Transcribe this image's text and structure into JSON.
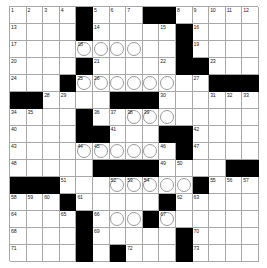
{
  "puzzle": {
    "title": "Crossword Grid",
    "rows": 15,
    "cols": 15,
    "colors": {
      "block": "#000000",
      "cell": "#ffffff",
      "gridline": "#a8a8a8",
      "number": "#222222",
      "circle": "#9a9a9a",
      "page": "#ffffff"
    },
    "legend": {
      "block_char": "#",
      "open_char": ".",
      "circle_char": "O"
    },
    "layout": [
      "....#..........",
      "....#....#.....",
      "....OOOO..#....",
      "....#....#.#...",
      "...#OOOOOO.#.##",
      "##.....###...>>",
      "....#OOOOOO....",
      "....##...##....",
      "....OOOOO.#....",
      "....#####..#.##",
      "###.#.OOOOO#...",
      "...#...#..#..>>",
      "...#.#.OOO.....",
      "....#.#...#....",
      "...#.#.#...#..."
    ],
    "numbers": [
      {
        "r": 1,
        "c": 1,
        "n": "1"
      },
      {
        "r": 1,
        "c": 2,
        "n": "2"
      },
      {
        "r": 1,
        "c": 3,
        "n": "3"
      },
      {
        "r": 1,
        "c": 4,
        "n": "4"
      },
      {
        "r": 1,
        "c": 6,
        "n": "5"
      },
      {
        "r": 1,
        "c": 7,
        "n": "6"
      },
      {
        "r": 1,
        "c": 8,
        "n": "7"
      },
      {
        "r": 1,
        "c": 11,
        "n": "8"
      },
      {
        "r": 1,
        "c": 12,
        "n": "9"
      },
      {
        "r": 1,
        "c": 13,
        "n": "10"
      },
      {
        "r": 1,
        "c": 14,
        "n": "11"
      },
      {
        "r": 1,
        "c": 15,
        "n": "12"
      },
      {
        "r": 2,
        "c": 1,
        "n": "13"
      },
      {
        "r": 2,
        "c": 6,
        "n": "14"
      },
      {
        "r": 2,
        "c": 10,
        "n": "15"
      },
      {
        "r": 2,
        "c": 12,
        "n": "16"
      },
      {
        "r": 3,
        "c": 1,
        "n": "17"
      },
      {
        "r": 3,
        "c": 5,
        "n": "18"
      },
      {
        "r": 3,
        "c": 12,
        "n": "19"
      },
      {
        "r": 4,
        "c": 1,
        "n": "20"
      },
      {
        "r": 4,
        "c": 6,
        "n": "21"
      },
      {
        "r": 4,
        "c": 10,
        "n": "22"
      },
      {
        "r": 4,
        "c": 13,
        "n": "23"
      },
      {
        "r": 5,
        "c": 1,
        "n": "24"
      },
      {
        "r": 5,
        "c": 5,
        "n": "25"
      },
      {
        "r": 5,
        "c": 6,
        "n": "26"
      },
      {
        "r": 5,
        "c": 12,
        "n": "27"
      },
      {
        "r": 6,
        "c": 3,
        "n": "28"
      },
      {
        "r": 6,
        "c": 4,
        "n": "29"
      },
      {
        "r": 6,
        "c": 10,
        "n": "30"
      },
      {
        "r": 6,
        "c": 13,
        "n": "31"
      },
      {
        "r": 6,
        "c": 14,
        "n": "32"
      },
      {
        "r": 6,
        "c": 15,
        "n": "33"
      },
      {
        "r": 7,
        "c": 1,
        "n": "34"
      },
      {
        "r": 7,
        "c": 2,
        "n": "35"
      },
      {
        "r": 7,
        "c": 6,
        "n": "36"
      },
      {
        "r": 7,
        "c": 7,
        "n": "37"
      },
      {
        "r": 7,
        "c": 8,
        "n": "38"
      },
      {
        "r": 7,
        "c": 9,
        "n": "39"
      },
      {
        "r": 8,
        "c": 1,
        "n": "40"
      },
      {
        "r": 8,
        "c": 7,
        "n": "41"
      },
      {
        "r": 8,
        "c": 12,
        "n": "42"
      },
      {
        "r": 9,
        "c": 1,
        "n": "43"
      },
      {
        "r": 9,
        "c": 5,
        "n": "44"
      },
      {
        "r": 9,
        "c": 6,
        "n": "45"
      },
      {
        "r": 9,
        "c": 10,
        "n": "46"
      },
      {
        "r": 9,
        "c": 12,
        "n": "47"
      },
      {
        "r": 10,
        "c": 1,
        "n": "48"
      },
      {
        "r": 10,
        "c": 10,
        "n": "49"
      },
      {
        "r": 10,
        "c": 11,
        "n": "50"
      },
      {
        "r": 11,
        "c": 4,
        "n": "51"
      },
      {
        "r": 11,
        "c": 7,
        "n": "52"
      },
      {
        "r": 11,
        "c": 8,
        "n": "53"
      },
      {
        "r": 11,
        "c": 9,
        "n": "54"
      },
      {
        "r": 11,
        "c": 13,
        "n": "55"
      },
      {
        "r": 11,
        "c": 14,
        "n": "56"
      },
      {
        "r": 11,
        "c": 15,
        "n": "57"
      },
      {
        "r": 12,
        "c": 1,
        "n": "58"
      },
      {
        "r": 12,
        "c": 2,
        "n": "59"
      },
      {
        "r": 12,
        "c": 3,
        "n": "60"
      },
      {
        "r": 12,
        "c": 5,
        "n": "61"
      },
      {
        "r": 12,
        "c": 11,
        "n": "62"
      },
      {
        "r": 12,
        "c": 12,
        "n": "63"
      },
      {
        "r": 13,
        "c": 1,
        "n": "64"
      },
      {
        "r": 13,
        "c": 4,
        "n": "65"
      },
      {
        "r": 13,
        "c": 6,
        "n": "66"
      },
      {
        "r": 13,
        "c": 10,
        "n": "67"
      },
      {
        "r": 14,
        "c": 1,
        "n": "68"
      },
      {
        "r": 14,
        "c": 6,
        "n": "69"
      },
      {
        "r": 14,
        "c": 12,
        "n": "70"
      },
      {
        "r": 15,
        "c": 1,
        "n": "71"
      },
      {
        "r": 15,
        "c": 8,
        "n": "72"
      },
      {
        "r": 15,
        "c": 12,
        "n": "73"
      }
    ],
    "blocks": [
      {
        "r": 1,
        "c": 5
      },
      {
        "r": 1,
        "c": 9
      },
      {
        "r": 1,
        "c": 10
      },
      {
        "r": 2,
        "c": 5
      },
      {
        "r": 2,
        "c": 11
      },
      {
        "r": 3,
        "c": 11
      },
      {
        "r": 4,
        "c": 5
      },
      {
        "r": 4,
        "c": 11
      },
      {
        "r": 4,
        "c": 12
      },
      {
        "r": 5,
        "c": 4
      },
      {
        "r": 5,
        "c": 13
      },
      {
        "r": 5,
        "c": 14
      },
      {
        "r": 5,
        "c": 15
      },
      {
        "r": 6,
        "c": 1
      },
      {
        "r": 6,
        "c": 2
      },
      {
        "r": 6,
        "c": 7
      },
      {
        "r": 6,
        "c": 8
      },
      {
        "r": 6,
        "c": 9
      },
      {
        "r": 7,
        "c": 5
      },
      {
        "r": 8,
        "c": 5
      },
      {
        "r": 8,
        "c": 6
      },
      {
        "r": 8,
        "c": 10
      },
      {
        "r": 8,
        "c": 11
      },
      {
        "r": 9,
        "c": 11
      },
      {
        "r": 10,
        "c": 6
      },
      {
        "r": 10,
        "c": 7
      },
      {
        "r": 10,
        "c": 8
      },
      {
        "r": 10,
        "c": 9
      },
      {
        "r": 10,
        "c": 14
      },
      {
        "r": 10,
        "c": 15
      },
      {
        "r": 11,
        "c": 1
      },
      {
        "r": 11,
        "c": 2
      },
      {
        "r": 11,
        "c": 3
      },
      {
        "r": 11,
        "c": 12
      },
      {
        "r": 12,
        "c": 4
      },
      {
        "r": 12,
        "c": 10
      },
      {
        "r": 13,
        "c": 5
      },
      {
        "r": 13,
        "c": 9
      },
      {
        "r": 14,
        "c": 5
      },
      {
        "r": 14,
        "c": 11
      },
      {
        "r": 15,
        "c": 5
      },
      {
        "r": 15,
        "c": 7
      },
      {
        "r": 15,
        "c": 11
      }
    ],
    "circles": [
      {
        "r": 3,
        "c": 5
      },
      {
        "r": 3,
        "c": 6
      },
      {
        "r": 3,
        "c": 7
      },
      {
        "r": 3,
        "c": 8
      },
      {
        "r": 5,
        "c": 5
      },
      {
        "r": 5,
        "c": 6
      },
      {
        "r": 5,
        "c": 7
      },
      {
        "r": 5,
        "c": 8
      },
      {
        "r": 5,
        "c": 9
      },
      {
        "r": 5,
        "c": 10
      },
      {
        "r": 7,
        "c": 8
      },
      {
        "r": 7,
        "c": 9
      },
      {
        "r": 7,
        "c": 10
      },
      {
        "r": 9,
        "c": 5
      },
      {
        "r": 9,
        "c": 6
      },
      {
        "r": 9,
        "c": 7
      },
      {
        "r": 9,
        "c": 8
      },
      {
        "r": 9,
        "c": 9
      },
      {
        "r": 11,
        "c": 7
      },
      {
        "r": 11,
        "c": 8
      },
      {
        "r": 11,
        "c": 9
      },
      {
        "r": 11,
        "c": 10
      },
      {
        "r": 11,
        "c": 11
      },
      {
        "r": 13,
        "c": 7
      },
      {
        "r": 13,
        "c": 8
      },
      {
        "r": 13,
        "c": 9
      },
      {
        "r": 13,
        "c": 10
      }
    ]
  }
}
